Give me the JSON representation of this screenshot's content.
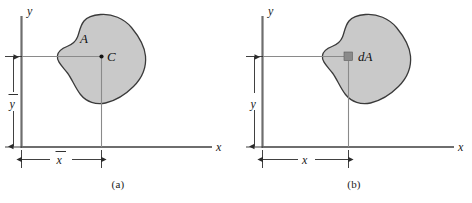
{
  "figure": {
    "background_color": "#ffffff",
    "width": 472,
    "height": 203
  },
  "style": {
    "blob_fill": "#c9c9c9",
    "blob_stroke": "#3a3a3a",
    "axis_color": "#6e6e6e",
    "leader_color": "#8a8a8a",
    "dimension_color": "#2b2b2b",
    "text_color": "#1a1a1a",
    "element_fill": "#8a8a8a"
  },
  "panels": [
    {
      "id": "a",
      "caption": "(a)",
      "axis": {
        "y_label": "y",
        "x_label": "x"
      },
      "area_label": "A",
      "point_label": "C",
      "point_marker": "centroid-dot",
      "dimensions": [
        {
          "name": "x-bar",
          "label": "x",
          "overbar": true,
          "orientation": "horizontal"
        },
        {
          "name": "y-bar",
          "label": "y",
          "overbar": true,
          "orientation": "vertical"
        }
      ]
    },
    {
      "id": "b",
      "caption": "(b)",
      "axis": {
        "y_label": "y",
        "x_label": "x"
      },
      "element_label": "dA",
      "element_marker": "differential-area-square",
      "dimensions": [
        {
          "name": "x",
          "label": "x",
          "overbar": false,
          "orientation": "horizontal"
        },
        {
          "name": "y",
          "label": "y",
          "overbar": false,
          "orientation": "vertical"
        }
      ]
    }
  ]
}
